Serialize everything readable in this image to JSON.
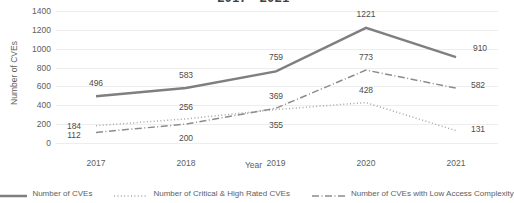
{
  "chart_data": {
    "type": "line",
    "title": "2017 - 2021",
    "xlabel": "Year",
    "ylabel": "Number of CVEs",
    "categories": [
      "2017",
      "2018",
      "2019",
      "2020",
      "2021"
    ],
    "ylim": [
      0,
      1400
    ],
    "yticks": [
      "0",
      "200",
      "400",
      "600",
      "800",
      "1000",
      "1200",
      "1400"
    ],
    "grid": true,
    "legend_position": "bottom",
    "series": [
      {
        "name": "Number of CVEs",
        "style": "solid",
        "color": "#7f7f7f",
        "values": [
          496,
          583,
          759,
          1221,
          910
        ],
        "labels": [
          "496",
          "583",
          "759",
          "1221",
          "910"
        ]
      },
      {
        "name": "Number of Critical & High Rated CVEs",
        "style": "dotted",
        "color": "#a6a6a6",
        "values": [
          184,
          256,
          355,
          428,
          131
        ],
        "labels": [
          "184",
          "256",
          "355",
          "428",
          "131"
        ]
      },
      {
        "name": "Number of CVEs with Low Access Complexity",
        "style": "dash-dot",
        "color": "#8c8c8c",
        "values": [
          112,
          200,
          369,
          773,
          582
        ],
        "labels": [
          "112",
          "200",
          "369",
          "773",
          "582"
        ]
      }
    ]
  }
}
